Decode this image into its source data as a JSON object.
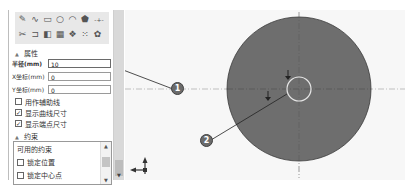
{
  "toolbar": {
    "row1": [
      {
        "icon": "line-icon",
        "glyph": "✎"
      },
      {
        "icon": "spline-icon",
        "glyph": "∿"
      },
      {
        "icon": "rectangle-icon",
        "glyph": "▭"
      },
      {
        "icon": "circle-icon",
        "glyph": "○"
      },
      {
        "icon": "arc-icon",
        "glyph": "◠"
      },
      {
        "icon": "polygon-icon",
        "glyph": "⬟"
      },
      {
        "icon": "centerline-icon",
        "glyph": "-+-"
      }
    ],
    "row2": [
      {
        "icon": "trim-icon",
        "glyph": "✂"
      },
      {
        "icon": "offset-icon",
        "glyph": "⊐"
      },
      {
        "icon": "mirror-icon",
        "glyph": "◧"
      },
      {
        "icon": "pattern-icon",
        "glyph": "▦"
      },
      {
        "icon": "transform-icon",
        "glyph": "❖"
      },
      {
        "icon": "grid-points-icon",
        "glyph": "⁙"
      },
      {
        "icon": "settings-icon",
        "glyph": "✿"
      }
    ]
  },
  "properties": {
    "title": "属性",
    "radius": {
      "label": "半径(mm)",
      "value": "10"
    },
    "x": {
      "label": "X坐标(mm)",
      "value": "0"
    },
    "y": {
      "label": "Y坐标(mm)",
      "value": "0"
    },
    "checks": [
      {
        "label": "用作辅助线",
        "checked": false
      },
      {
        "label": "显示曲线尺寸",
        "checked": true
      },
      {
        "label": "显示端点尺寸",
        "checked": true
      }
    ]
  },
  "constraints": {
    "title": "约束",
    "list_header": "可用的约束",
    "items": [
      {
        "label": "锁定位置",
        "checked": false
      },
      {
        "label": "锁定中心点",
        "checked": false
      }
    ]
  },
  "callouts": {
    "one": "1",
    "two": "2"
  },
  "canvas": {
    "circle_fill": "#6e6e6e",
    "small_circle_stroke": "#e6e6e6",
    "axis_labels": {
      "y": "z",
      "x": "x"
    }
  }
}
